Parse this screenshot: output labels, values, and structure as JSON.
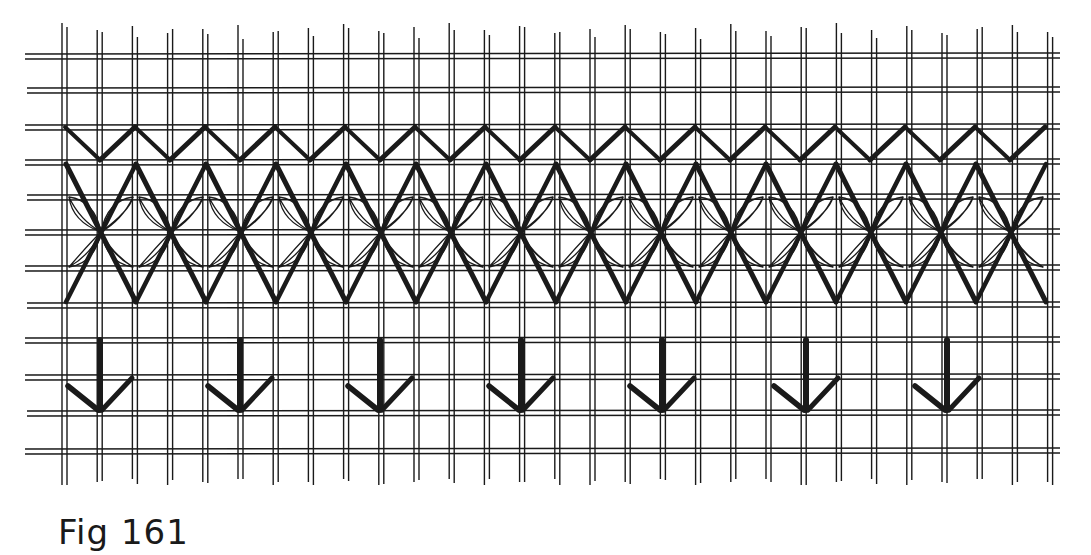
{
  "figure": {
    "caption": "Fig 161",
    "ink_color": "#1a1a1a",
    "background_color": "#ffffff",
    "grid": {
      "horizontal_rows_y": [
        56,
        90,
        127,
        162,
        197,
        232,
        268,
        305,
        340,
        377,
        413,
        451
      ],
      "horizontal_x_range": [
        25,
        1060
      ],
      "vertical_pair_count": 29,
      "vertical_first_x": 62,
      "vertical_spacing": 35.2,
      "vertical_pair_gap": 5,
      "vertical_y_range": [
        25,
        485
      ]
    },
    "bands": [
      {
        "name": "top-zigzag",
        "type": "zigzag",
        "top_y": 127,
        "bottom_y": 160,
        "start_x": 65,
        "half_period": 35,
        "count": 30
      },
      {
        "name": "diamond-band",
        "type": "diamond-lattice",
        "top_y": 164,
        "mid_y": 232,
        "bottom_y": 302,
        "start_x": 62,
        "period": 70,
        "count": 14,
        "inner_petals": true
      },
      {
        "name": "arrow-row",
        "type": "arrows",
        "stem_top_y": 340,
        "tip_y": 410,
        "arm_y": 380,
        "arm_dx": 32,
        "centers_x": [
          100,
          240,
          380,
          521,
          662,
          806,
          947
        ]
      }
    ]
  }
}
